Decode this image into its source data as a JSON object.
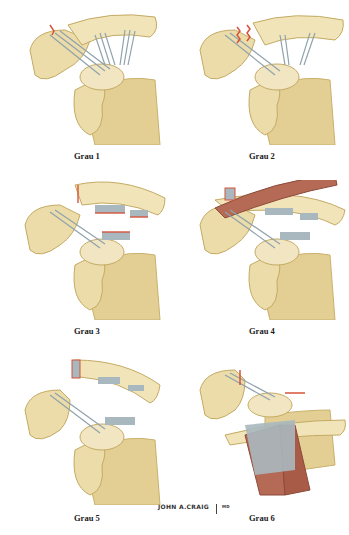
{
  "figure": {
    "panels": [
      {
        "id": 1,
        "label": "Grau 1",
        "description": "Sprain of AC ligament, coracoclavicular ligaments intact"
      },
      {
        "id": 2,
        "label": "Grau 2",
        "description": "AC ligament torn, coracoclavicular ligaments intact"
      },
      {
        "id": 3,
        "label": "Grau 3",
        "description": "AC and coracoclavicular ligaments torn"
      },
      {
        "id": 4,
        "label": "Grau 4",
        "description": "Clavicle displaced posteriorly through trapezius"
      },
      {
        "id": 5,
        "label": "Grau 5",
        "description": "Clavicle markedly displaced superiorly"
      },
      {
        "id": 6,
        "label": "Grau 6",
        "description": "Clavicle displaced inferiorly beneath coracoid"
      }
    ],
    "signature": "JOHN A.CRAIG",
    "signature_suffix": "MD"
  },
  "colors": {
    "bone": "#e9d9a6",
    "bone_shadow": "#c9b16e",
    "bone_light": "#f6eccc",
    "ligament": "#a9b8bf",
    "ligament_dark": "#7d8f98",
    "tear": "#d4533a",
    "muscle": "#b46a55",
    "muscle_dark": "#8d4a3a",
    "label": "#1a1a1a"
  }
}
